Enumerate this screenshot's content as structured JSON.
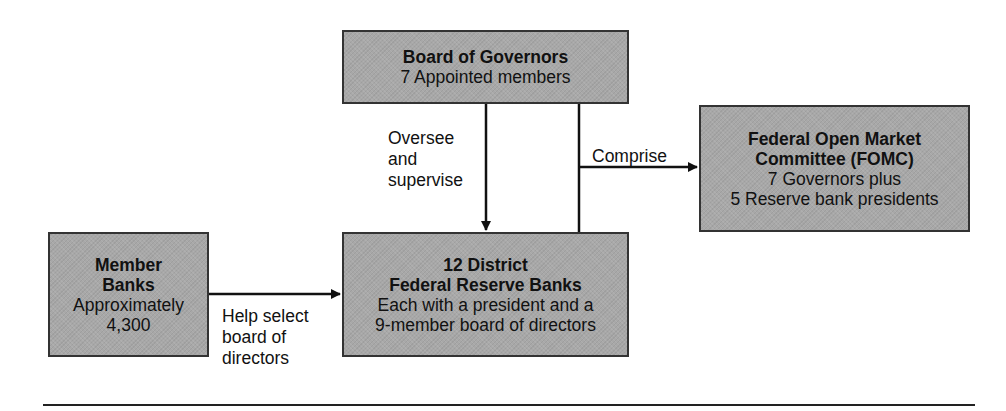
{
  "nodes": {
    "board": {
      "title": "Board of Governors",
      "lines": [
        "7 Appointed members"
      ]
    },
    "fomc": {
      "title_lines": [
        "Federal Open Market",
        "Committee (FOMC)"
      ],
      "lines": [
        "7 Governors plus",
        "5 Reserve bank presidents"
      ]
    },
    "member": {
      "title_lines": [
        "Member",
        "Banks"
      ],
      "lines": [
        "Approximately",
        "4,300"
      ]
    },
    "district": {
      "title_lines": [
        "12 District",
        "Federal Reserve Banks"
      ],
      "lines": [
        "Each with a president and a",
        "9-member board of directors"
      ]
    }
  },
  "edges": {
    "oversee": {
      "lines": [
        "Oversee",
        "and",
        "supervise"
      ]
    },
    "comprise": {
      "label": "Comprise"
    },
    "help_select": {
      "lines": [
        "Help select",
        "board of",
        "directors"
      ]
    }
  },
  "colors": {
    "box_fill": "#a8a8a8",
    "line": "#111111"
  }
}
